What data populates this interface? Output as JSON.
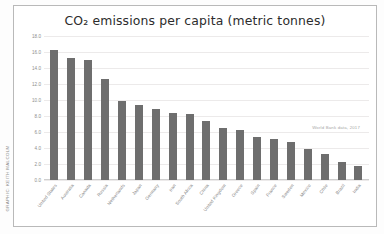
{
  "watermark": {
    "text": "GRAPHIC: KEITH MALCOLM"
  },
  "chart_data": {
    "type": "bar",
    "title": "CO₂ emissions per capita (metric tonnes)",
    "xlabel": "",
    "ylabel": "",
    "ylim": [
      0,
      18
    ],
    "ytick_step": 2,
    "grid": true,
    "legend": false,
    "bar_color": "#6e6e6e",
    "source_note": "World Bank data, 2017",
    "yticks": [
      "0.0",
      "2.0",
      "4.0",
      "6.0",
      "8.0",
      "10.0",
      "12.0",
      "14.0",
      "16.0",
      "18.0"
    ],
    "categories": [
      "United States",
      "Australia",
      "Canada",
      "Russia",
      "Netherlands",
      "Japan",
      "Germany",
      "Iran",
      "South Africa",
      "China",
      "United Kingdom",
      "Greece",
      "Spain",
      "France",
      "Sweden",
      "Mexico",
      "Chile",
      "Brazil",
      "India"
    ],
    "values": [
      16.2,
      15.2,
      15.0,
      12.6,
      9.9,
      9.4,
      8.9,
      8.4,
      8.2,
      7.4,
      6.5,
      6.2,
      5.4,
      5.1,
      4.8,
      3.9,
      3.3,
      2.3,
      1.7
    ]
  }
}
